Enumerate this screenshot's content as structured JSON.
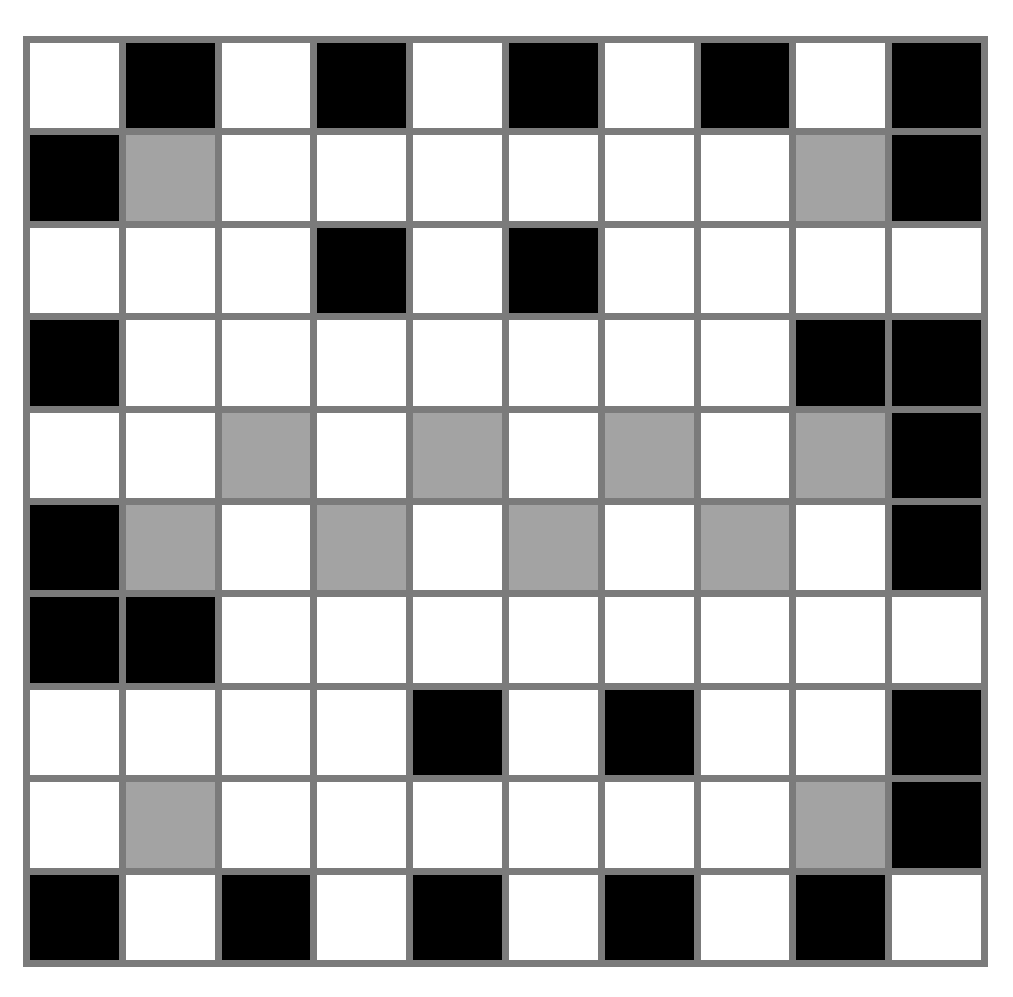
{
  "board": {
    "rows": 10,
    "cols": 10,
    "legend": {
      "W": "white",
      "B": "black",
      "G": "gray"
    },
    "colors": {
      "W": "#ffffff",
      "B": "#000000",
      "G": "#a3a3a3",
      "grid_line": "#7b7b7b"
    },
    "grid": [
      [
        "W",
        "B",
        "W",
        "B",
        "W",
        "B",
        "W",
        "B",
        "W",
        "B"
      ],
      [
        "B",
        "G",
        "W",
        "W",
        "W",
        "W",
        "W",
        "W",
        "G",
        "B"
      ],
      [
        "W",
        "W",
        "W",
        "B",
        "W",
        "B",
        "W",
        "W",
        "W",
        "W"
      ],
      [
        "B",
        "W",
        "W",
        "W",
        "W",
        "W",
        "W",
        "W",
        "B",
        "B"
      ],
      [
        "W",
        "W",
        "G",
        "W",
        "G",
        "W",
        "G",
        "W",
        "G",
        "B"
      ],
      [
        "B",
        "G",
        "W",
        "G",
        "W",
        "G",
        "W",
        "G",
        "W",
        "B"
      ],
      [
        "B",
        "B",
        "W",
        "W",
        "W",
        "W",
        "W",
        "W",
        "W",
        "W"
      ],
      [
        "W",
        "W",
        "W",
        "W",
        "B",
        "W",
        "B",
        "W",
        "W",
        "B"
      ],
      [
        "W",
        "G",
        "W",
        "W",
        "W",
        "W",
        "W",
        "W",
        "G",
        "B"
      ],
      [
        "B",
        "W",
        "B",
        "W",
        "B",
        "W",
        "B",
        "W",
        "B",
        "W"
      ]
    ]
  }
}
